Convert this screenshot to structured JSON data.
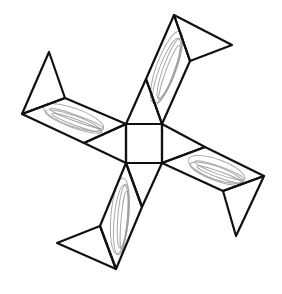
{
  "diagram": {
    "type": "geometric-net",
    "colors": {
      "line": "#111111",
      "shading": "#9a9a9a",
      "background": "#ffffff"
    },
    "square": [
      [
        126,
        124
      ],
      [
        162,
        124
      ],
      [
        162,
        163
      ],
      [
        126,
        163
      ]
    ],
    "polygons": [
      {
        "name": "top-arm-inner-triangle",
        "points": [
          [
            126,
            124
          ],
          [
            162,
            124
          ],
          [
            146,
            79
          ]
        ]
      },
      {
        "name": "top-arm-band",
        "points": [
          [
            146,
            79
          ],
          [
            174,
            15
          ],
          [
            190,
            61
          ],
          [
            162,
            124
          ]
        ]
      },
      {
        "name": "top-arm-flap",
        "points": [
          [
            174,
            15
          ],
          [
            232,
            45
          ],
          [
            190,
            61
          ]
        ]
      },
      {
        "name": "right-arm-inner-triangle",
        "points": [
          [
            162,
            124
          ],
          [
            162,
            163
          ],
          [
            205,
            147
          ]
        ]
      },
      {
        "name": "right-arm-band",
        "points": [
          [
            162,
            163
          ],
          [
            205,
            147
          ],
          [
            264,
            176
          ],
          [
            223,
            191
          ]
        ]
      },
      {
        "name": "right-arm-flap",
        "points": [
          [
            223,
            191
          ],
          [
            264,
            176
          ],
          [
            236,
            236
          ]
        ]
      },
      {
        "name": "bottom-arm-inner-triangle",
        "points": [
          [
            126,
            163
          ],
          [
            162,
            163
          ],
          [
            142,
            207
          ]
        ]
      },
      {
        "name": "bottom-arm-band",
        "points": [
          [
            126,
            163
          ],
          [
            142,
            207
          ],
          [
            116,
            269
          ],
          [
            100,
            226
          ]
        ]
      },
      {
        "name": "bottom-arm-flap",
        "points": [
          [
            100,
            226
          ],
          [
            116,
            269
          ],
          [
            57,
            243
          ]
        ]
      },
      {
        "name": "left-arm-inner-triangle",
        "points": [
          [
            126,
            124
          ],
          [
            126,
            163
          ],
          [
            84,
            143
          ]
        ]
      },
      {
        "name": "left-arm-band",
        "points": [
          [
            126,
            124
          ],
          [
            65,
            98
          ],
          [
            22,
            114
          ],
          [
            84,
            143
          ]
        ]
      },
      {
        "name": "left-arm-flap",
        "points": [
          [
            22,
            114
          ],
          [
            65,
            98
          ],
          [
            49,
            52
          ]
        ]
      }
    ],
    "shaded_regions": [
      {
        "name": "top-band-shading",
        "cx": 168,
        "cy": 70,
        "rx": 10,
        "ry": 38,
        "rotate": 20
      },
      {
        "name": "right-band-shading",
        "cx": 218,
        "cy": 172,
        "rx": 30,
        "ry": 10,
        "rotate": 20
      },
      {
        "name": "bottom-band-shading",
        "cx": 122,
        "cy": 218,
        "rx": 9,
        "ry": 38,
        "rotate": 5
      },
      {
        "name": "left-band-shading",
        "cx": 75,
        "cy": 120,
        "rx": 32,
        "ry": 9,
        "rotate": 20
      }
    ]
  }
}
